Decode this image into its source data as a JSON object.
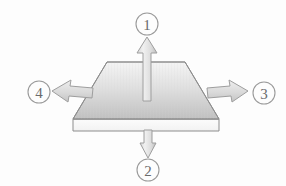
{
  "figure": {
    "background_color": "#fdfdfd",
    "style": "grayscale technical perspective diagram"
  },
  "colors": {
    "outline": "#8d8d8d",
    "arrow_outline": "#9e9e9e",
    "circle_stroke": "#9a9a9a",
    "label_text": "#6a6a6a",
    "plate_top_light": "#f2f2f2",
    "plate_top_dark": "#c2c2c2",
    "plate_side_fill": "#fbfbfb",
    "arrow_fill_light": "#eeeeee",
    "arrow_fill_dark": "#c9c9c9"
  },
  "plate": {
    "name": "flat plate",
    "shape": "trapezoid perspective slab",
    "top_face": {
      "points": "107,62 185,62 219,119 73,119"
    },
    "front_face": {
      "points": "73,119 219,119 219,131 73,131"
    }
  },
  "arrows": [
    {
      "id": 1,
      "name": "up-arrow",
      "direction": "up",
      "label": "1",
      "label_cx": 147,
      "label_cy": 24,
      "label_r": 11,
      "points": "147,37 157,53 151,53 151,101 143,101 143,53 137,53",
      "orientation": "vertical"
    },
    {
      "id": 2,
      "name": "down-arrow",
      "direction": "down",
      "label": "2",
      "label_cx": 148,
      "label_cy": 170,
      "label_r": 11,
      "points": "148,158 140,143 144,143 144,130 152,130 152,143 156,143",
      "orientation": "vertical"
    },
    {
      "id": 3,
      "name": "right-arrow",
      "direction": "right",
      "label": "3",
      "label_cx": 264,
      "label_cy": 93,
      "label_r": 11,
      "points": "248,91 229,80 230,86 207,88 208,98 231,96 232,102",
      "orientation": "perspective-right"
    },
    {
      "id": 4,
      "name": "left-arrow",
      "direction": "left",
      "label": "4",
      "label_cx": 39,
      "label_cy": 92,
      "label_r": 11,
      "points": "52,91 71,80 70,86 93,88 92,98 69,96 68,102",
      "orientation": "perspective-left"
    }
  ],
  "labels": {
    "one": "1",
    "two": "2",
    "three": "3",
    "four": "4"
  }
}
